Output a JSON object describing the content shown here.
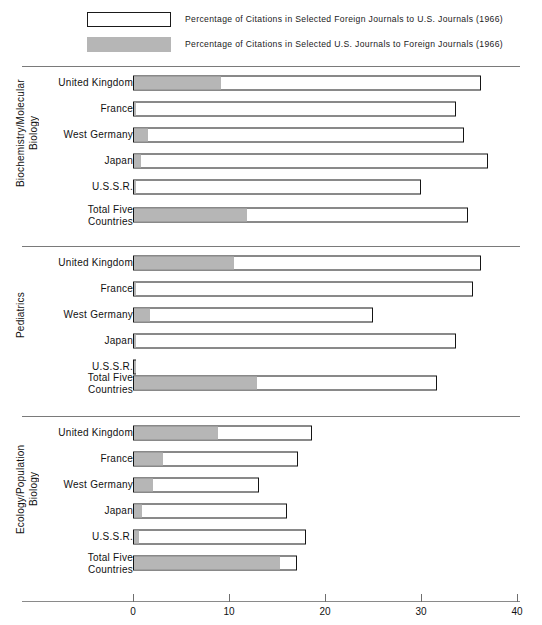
{
  "legend": {
    "items": [
      {
        "swatch": "open-rectangle",
        "label": "Percentage of Citations in Selected Foreign Journals to U.S. Journals (1966)"
      },
      {
        "swatch": "gray-filled-rectangle",
        "label": "Percentage of Citations in Selected U.S. Journals to Foreign Journals (1966)"
      }
    ]
  },
  "colors": {
    "foreign_to_us": "#ffffff",
    "us_to_foreign": "#b6b6b6",
    "outline": "#151515",
    "rule": "#7a7a7a"
  },
  "axis": {
    "ticks": [
      "0",
      "10",
      "20",
      "30",
      "40"
    ],
    "min": 0,
    "max": 42
  },
  "chart_data": {
    "type": "bar",
    "orientation": "horizontal",
    "title": "",
    "xlabel": "",
    "ylabel": "",
    "xlim": [
      0,
      42
    ],
    "grid": false,
    "legend_position": "top",
    "series": [
      {
        "name": "Percentage of Citations in Selected Foreign Journals to U.S. Journals (1966)",
        "key": "foreign_to_us"
      },
      {
        "name": "Percentage of Citations in Selected U.S. Journals to Foreign Journals (1966)",
        "key": "us_to_foreign"
      }
    ],
    "panels": [
      {
        "label": "Biochemistry/Molecular\nBiology",
        "categories": [
          "United Kingdom",
          "France",
          "West Germany",
          "Japan",
          "U.S.S.R.",
          "Total Five\nCountries"
        ],
        "foreign_to_us": [
          36.2,
          33.6,
          34.5,
          37.0,
          30.0,
          34.9
        ],
        "us_to_foreign": [
          9.2,
          0.4,
          1.6,
          0.9,
          0.2,
          11.9
        ]
      },
      {
        "label": "Pediatrics",
        "categories": [
          "United Kingdom",
          "France",
          "West Germany",
          "Japan",
          "U.S.S.R.",
          "Total Five\nCountries"
        ],
        "foreign_to_us": [
          36.2,
          35.4,
          25.0,
          33.6,
          0.3,
          31.7
        ],
        "us_to_foreign": [
          10.6,
          0.3,
          1.8,
          0.2,
          0.3,
          13.0
        ]
      },
      {
        "label": "Ecology/Population\nBiology",
        "categories": [
          "United Kingdom",
          "France",
          "West Germany",
          "Japan",
          "U.S.S.R.",
          "Total Five\nCountries"
        ],
        "foreign_to_us": [
          18.6,
          17.2,
          13.1,
          16.0,
          18.0,
          17.1
        ],
        "us_to_foreign": [
          8.9,
          3.2,
          2.1,
          1.0,
          0.7,
          15.4
        ]
      }
    ]
  }
}
